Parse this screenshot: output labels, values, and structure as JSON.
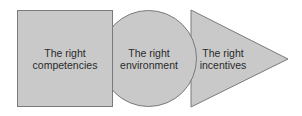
{
  "diagram": {
    "fill_color": "#c9c9c9",
    "stroke_color": "#7a7a7a",
    "shapes": [
      {
        "shape": "square",
        "line1": "The right",
        "line2": "competencies"
      },
      {
        "shape": "circle",
        "line1": "The right",
        "line2": "environment"
      },
      {
        "shape": "triangle",
        "line1": "The right",
        "line2": "incentives"
      }
    ]
  }
}
